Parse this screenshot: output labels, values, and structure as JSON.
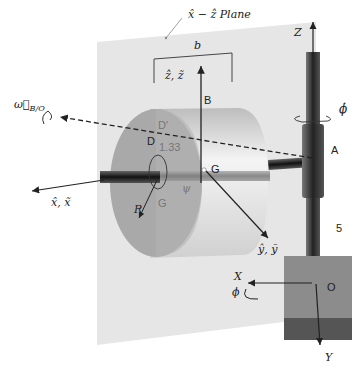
{
  "diagram": {
    "type": "3D mechanical system schematic",
    "plane_label": "x̂ − ẑ Plane",
    "dimension_b": "b",
    "labels": {
      "z_hat_z": "ẑ, z̃",
      "x_hat_x": "x̂, x̃",
      "y_hat_y": "ŷ, ỹ",
      "omega": "ω⃗",
      "omega_sub": "B/O",
      "phi_dot": "ϕ̇",
      "phi": "ϕ",
      "psi": "ψ",
      "R": "R",
      "Z": "Z",
      "X": "X",
      "Y": "Y",
      "A": "A",
      "B": "B",
      "D": "D",
      "D_prime": "D'",
      "G_center": "G",
      "G_face": "G",
      "O": "O",
      "value_133": "1.33",
      "value_5": "5"
    },
    "colors": {
      "plane": "#e6e6e6",
      "cylinder_face": "#a9a9a9",
      "cylinder_body": "#dcdcdc",
      "rod_dark": "#2a2a2a",
      "base_top": "#8c8c8c",
      "base_bottom": "#555555"
    }
  }
}
